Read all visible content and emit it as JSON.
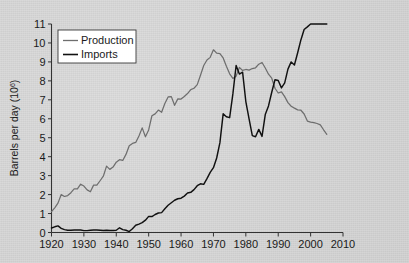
{
  "chart_data": {
    "type": "line",
    "title": "",
    "xlabel": "",
    "ylabel": "Barrels per day (10⁶)",
    "ylabel_base": "Barrels per day (10",
    "ylabel_exp": "6",
    "ylabel_close": ")",
    "xlim": [
      1920,
      2010
    ],
    "ylim": [
      0,
      11
    ],
    "grid": false,
    "legend_position": "top-left",
    "xticks": [
      1920,
      1930,
      1940,
      1950,
      1960,
      1970,
      1980,
      1990,
      2000,
      2010
    ],
    "yticks": [
      0,
      1,
      2,
      3,
      4,
      5,
      6,
      7,
      8,
      9,
      10,
      11
    ],
    "colors": {
      "production": "#6e6e6e",
      "imports": "#111111",
      "axis": "#333333",
      "background": "#d7d7d7",
      "legend_bg": "#ffffff"
    },
    "series": [
      {
        "name": "Production",
        "color": "#6e6e6e",
        "x": [
          1920,
          1921,
          1922,
          1923,
          1924,
          1925,
          1926,
          1927,
          1928,
          1929,
          1930,
          1931,
          1932,
          1933,
          1934,
          1935,
          1936,
          1937,
          1938,
          1939,
          1940,
          1941,
          1942,
          1943,
          1944,
          1945,
          1946,
          1947,
          1948,
          1949,
          1950,
          1951,
          1952,
          1953,
          1954,
          1955,
          1956,
          1957,
          1958,
          1959,
          1960,
          1961,
          1962,
          1963,
          1964,
          1965,
          1966,
          1967,
          1968,
          1969,
          1970,
          1971,
          1972,
          1973,
          1974,
          1975,
          1976,
          1977,
          1978,
          1979,
          1980,
          1981,
          1982,
          1983,
          1984,
          1985,
          1986,
          1987,
          1988,
          1989,
          1990,
          1991,
          1992,
          1993,
          1994,
          1995,
          1996,
          1997,
          1998,
          1999,
          2000,
          2001,
          2002,
          2003,
          2004,
          2005
        ],
        "values": [
          1.1,
          1.3,
          1.55,
          2.0,
          1.9,
          1.95,
          2.1,
          2.3,
          2.3,
          2.55,
          2.45,
          2.25,
          2.15,
          2.5,
          2.5,
          2.73,
          2.97,
          3.5,
          3.33,
          3.45,
          3.71,
          3.84,
          3.8,
          4.12,
          4.58,
          4.7,
          4.75,
          5.09,
          5.52,
          5.05,
          5.41,
          6.16,
          6.26,
          6.46,
          6.34,
          6.81,
          7.15,
          7.17,
          6.71,
          7.05,
          7.04,
          7.18,
          7.33,
          7.54,
          7.61,
          7.8,
          8.3,
          8.81,
          9.1,
          9.24,
          9.64,
          9.46,
          9.44,
          9.21,
          8.77,
          8.37,
          8.13,
          8.25,
          8.71,
          8.55,
          8.6,
          8.57,
          8.65,
          8.69,
          8.88,
          8.97,
          8.68,
          8.35,
          8.14,
          7.61,
          7.36,
          7.42,
          7.17,
          6.85,
          6.66,
          6.56,
          6.47,
          6.45,
          6.25,
          5.88,
          5.82,
          5.8,
          5.75,
          5.68,
          5.42,
          5.18
        ]
      },
      {
        "name": "Imports",
        "color": "#111111",
        "x": [
          1920,
          1921,
          1922,
          1923,
          1924,
          1925,
          1926,
          1927,
          1928,
          1929,
          1930,
          1931,
          1932,
          1933,
          1934,
          1935,
          1936,
          1937,
          1938,
          1939,
          1940,
          1941,
          1942,
          1943,
          1944,
          1945,
          1946,
          1947,
          1948,
          1949,
          1950,
          1951,
          1952,
          1953,
          1954,
          1955,
          1956,
          1957,
          1958,
          1959,
          1960,
          1961,
          1962,
          1963,
          1964,
          1965,
          1966,
          1967,
          1968,
          1969,
          1970,
          1971,
          1972,
          1973,
          1974,
          1975,
          1976,
          1977,
          1978,
          1979,
          1980,
          1981,
          1982,
          1983,
          1984,
          1985,
          1986,
          1987,
          1988,
          1989,
          1990,
          1991,
          1992,
          1993,
          1994,
          1995,
          1996,
          1997,
          1998,
          1999,
          2000,
          2001,
          2002,
          2003,
          2004,
          2005
        ],
        "values": [
          0.24,
          0.3,
          0.35,
          0.22,
          0.15,
          0.12,
          0.12,
          0.13,
          0.13,
          0.13,
          0.1,
          0.1,
          0.12,
          0.13,
          0.13,
          0.12,
          0.11,
          0.12,
          0.11,
          0.11,
          0.12,
          0.25,
          0.15,
          0.12,
          0.05,
          0.2,
          0.38,
          0.44,
          0.52,
          0.65,
          0.85,
          0.84,
          0.95,
          1.03,
          1.05,
          1.25,
          1.44,
          1.57,
          1.7,
          1.78,
          1.81,
          1.92,
          2.08,
          2.12,
          2.26,
          2.47,
          2.57,
          2.54,
          2.84,
          3.17,
          3.42,
          3.93,
          4.74,
          6.26,
          6.11,
          6.06,
          7.31,
          8.81,
          8.36,
          8.46,
          6.91,
          6.0,
          5.11,
          5.05,
          5.44,
          5.07,
          6.22,
          6.68,
          7.4,
          8.06,
          8.02,
          7.63,
          7.89,
          8.62,
          9.0,
          8.84,
          9.48,
          10.16,
          10.71,
          10.85,
          11.46,
          11.87,
          11.53,
          12.26,
          13.15,
          13.71
        ]
      }
    ],
    "legend_entries": [
      {
        "label": "Production",
        "color": "#6e6e6e"
      },
      {
        "label": "Imports",
        "color": "#111111"
      }
    ]
  }
}
